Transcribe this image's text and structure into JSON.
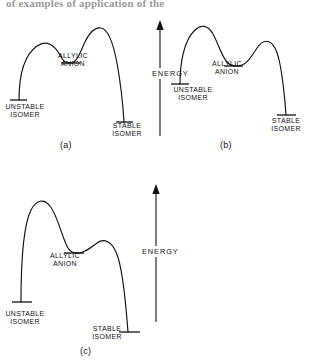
{
  "page": {
    "running_text": "of examples of application of the"
  },
  "figure": {
    "type": "reaction-energy-profile-diagrams",
    "panels": [
      {
        "id": "a",
        "caption": "(a)",
        "energy_axis_label": "ENERGY",
        "labels": {
          "unstable": "UNSTABLE\nISOMER",
          "allylic": "ALLYLIC\nANION",
          "stable": "STABLE\nISOMER"
        },
        "description": "Two transition-state maxima of similar height with the allylic anion intermediate in a shallow well between them; product well lies lower than reactant well.",
        "levels": {
          "unstable_isomer": 0.18,
          "first_transition_state": 0.78,
          "allylic_anion": 0.66,
          "second_transition_state": 0.92,
          "stable_isomer": 0.0
        }
      },
      {
        "id": "b",
        "caption": "(b)",
        "energy_axis_label": "ENERGY",
        "labels": {
          "unstable": "UNSTABLE\nISOMER",
          "allylic": "ALLYLIC\nANION",
          "stable": "STABLE\nISOMER"
        },
        "description": "First transition state is highest; allylic anion intermediate sits in a shallow well; second barrier is lower; stable isomer falls well below the unstable isomer.",
        "levels": {
          "unstable_isomer": 0.36,
          "first_transition_state": 1.0,
          "allylic_anion": 0.63,
          "second_transition_state": 0.78,
          "stable_isomer": 0.0
        }
      },
      {
        "id": "c",
        "caption": "(c)",
        "energy_axis_label": "ENERGY",
        "labels": {
          "unstable": "UNSTABLE\nISOMER",
          "allylic": "ALLYLIC\nANION",
          "stable": "STABLE\nISOMER"
        },
        "description": "Tall first transition state, deep allylic anion intermediate well, then a low broad second maximum before a deep stable isomer minimum.",
        "levels": {
          "unstable_isomer": 0.17,
          "first_transition_state": 1.0,
          "allylic_anion": 0.57,
          "second_transition_state": 0.66,
          "stable_isomer": 0.0
        }
      }
    ]
  },
  "colors": {
    "ink": "#111111",
    "background": "#ffffff"
  }
}
